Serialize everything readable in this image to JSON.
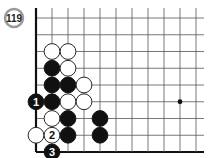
{
  "diagram": {
    "problem_number": "119",
    "board": {
      "columns": 11,
      "rows": 9,
      "edges": [
        "left",
        "bottom"
      ],
      "star_points": [
        {
          "col": 9,
          "row": 5
        }
      ]
    },
    "stones": [
      {
        "color": "white",
        "col": 1,
        "row": 2,
        "label": ""
      },
      {
        "color": "white",
        "col": 2,
        "row": 2,
        "label": ""
      },
      {
        "color": "black",
        "col": 1,
        "row": 3,
        "label": ""
      },
      {
        "color": "white",
        "col": 2,
        "row": 3,
        "label": ""
      },
      {
        "color": "black",
        "col": 1,
        "row": 4,
        "label": ""
      },
      {
        "color": "black",
        "col": 2,
        "row": 4,
        "label": ""
      },
      {
        "color": "white",
        "col": 3,
        "row": 4,
        "label": ""
      },
      {
        "color": "black",
        "col": 0,
        "row": 5,
        "label": "1"
      },
      {
        "color": "black",
        "col": 1,
        "row": 5,
        "label": ""
      },
      {
        "color": "white",
        "col": 2,
        "row": 5,
        "label": ""
      },
      {
        "color": "white",
        "col": 3,
        "row": 5,
        "label": ""
      },
      {
        "color": "white",
        "col": 1,
        "row": 6,
        "label": ""
      },
      {
        "color": "black",
        "col": 2,
        "row": 6,
        "label": ""
      },
      {
        "color": "black",
        "col": 4,
        "row": 6,
        "label": ""
      },
      {
        "color": "white",
        "col": 0,
        "row": 7,
        "label": ""
      },
      {
        "color": "white",
        "col": 1,
        "row": 7,
        "label": "2"
      },
      {
        "color": "black",
        "col": 2,
        "row": 7,
        "label": ""
      },
      {
        "color": "black",
        "col": 4,
        "row": 7,
        "label": ""
      },
      {
        "color": "black",
        "col": 1,
        "row": 8,
        "label": "3"
      }
    ],
    "colors": {
      "line": "#555555",
      "edge": "#111111",
      "black_stone": "#111111",
      "white_stone": "#ffffff",
      "badge_ring": "#9a9a9a"
    }
  }
}
